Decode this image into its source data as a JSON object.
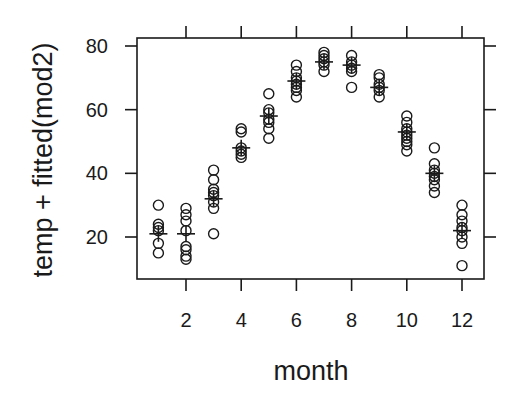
{
  "chart_data": {
    "type": "scatter",
    "title": "",
    "xlabel": "month",
    "ylabel": "temp + fitted(mod2)",
    "xlim": [
      0.3,
      12.8
    ],
    "ylim": [
      6,
      83
    ],
    "x_ticks": [
      2,
      4,
      6,
      8,
      10,
      12
    ],
    "y_ticks": [
      20,
      40,
      60,
      80
    ],
    "grid": false,
    "legend": null,
    "point_marker": "open-circle",
    "mean_marker": "plus",
    "points": [
      {
        "month": 1,
        "values": [
          30,
          24,
          23,
          22,
          18,
          15
        ]
      },
      {
        "month": 2,
        "values": [
          29,
          27,
          25,
          22,
          17,
          16,
          14,
          13
        ]
      },
      {
        "month": 3,
        "values": [
          41,
          38,
          35,
          34,
          33,
          31,
          29,
          21
        ]
      },
      {
        "month": 4,
        "values": [
          54,
          53,
          48,
          47,
          46,
          45
        ]
      },
      {
        "month": 5,
        "values": [
          65,
          60,
          59,
          57,
          56,
          54,
          51
        ]
      },
      {
        "month": 6,
        "values": [
          74,
          72,
          70,
          69,
          68,
          67,
          66,
          64
        ]
      },
      {
        "month": 7,
        "values": [
          78,
          77,
          76,
          75,
          74,
          72
        ]
      },
      {
        "month": 8,
        "values": [
          77,
          75,
          74,
          73,
          72,
          67
        ]
      },
      {
        "month": 9,
        "values": [
          71,
          70,
          68,
          67,
          66,
          64
        ]
      },
      {
        "month": 10,
        "values": [
          58,
          56,
          54,
          53,
          52,
          51,
          50,
          49,
          47
        ]
      },
      {
        "month": 11,
        "values": [
          48,
          43,
          41,
          40,
          39,
          38,
          36,
          34
        ]
      },
      {
        "month": 12,
        "values": [
          30,
          27,
          25,
          23,
          22,
          20,
          18,
          11
        ]
      }
    ],
    "means": [
      {
        "month": 1,
        "value": 21
      },
      {
        "month": 2,
        "value": 21
      },
      {
        "month": 3,
        "value": 32
      },
      {
        "month": 4,
        "value": 48
      },
      {
        "month": 5,
        "value": 58
      },
      {
        "month": 6,
        "value": 69
      },
      {
        "month": 7,
        "value": 75
      },
      {
        "month": 8,
        "value": 74
      },
      {
        "month": 9,
        "value": 67
      },
      {
        "month": 10,
        "value": 53
      },
      {
        "month": 11,
        "value": 40
      },
      {
        "month": 12,
        "value": 22
      }
    ]
  },
  "colors": {
    "ink": "#1a1a1a",
    "background": "#ffffff"
  }
}
